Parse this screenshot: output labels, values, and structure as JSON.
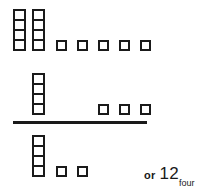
{
  "diagram": {
    "base": "four",
    "block_colors": {
      "outline": "#1a1a1a",
      "fill": "#ffffff",
      "background": "#ffffff"
    },
    "rows": [
      {
        "role": "first-addend",
        "rods": 2,
        "rod_height_in_units": 4,
        "units": 5,
        "value_description": "2 fours and 5 ones"
      },
      {
        "role": "second-addend",
        "rods": 1,
        "rod_height_in_units": 4,
        "units": 3,
        "value_description": "1 four and 3 ones"
      },
      {
        "role": "sum",
        "rods": 1,
        "rod_height_in_units": 4,
        "units": 2,
        "value_description": "1 four and 2 ones"
      }
    ],
    "rule": {
      "present": true,
      "role": "sum-separator"
    },
    "annotation": {
      "prefix": "or",
      "numeral": "12",
      "subscript": "four"
    }
  }
}
